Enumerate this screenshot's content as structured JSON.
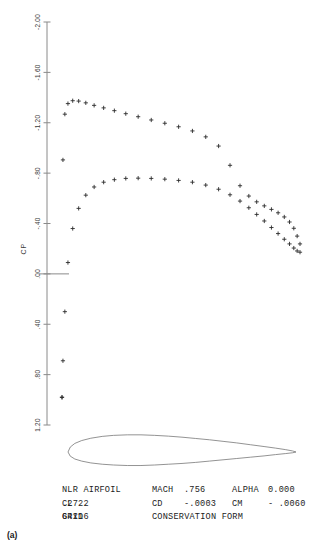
{
  "figure": {
    "panel_label": "(a)",
    "axis": {
      "ylabel": "CP",
      "yticks": [
        "-2.00",
        "-1.60",
        "-1.20",
        "-.80",
        "-.40",
        ".00",
        ".40",
        ".80",
        "1.20"
      ],
      "ytick_values": [
        -2.0,
        -1.6,
        -1.2,
        -0.8,
        -0.4,
        0.0,
        0.4,
        0.8,
        1.2
      ],
      "ylim": [
        -2.0,
        1.2
      ],
      "xlim": [
        0.0,
        1.0
      ],
      "grid": false,
      "zero_line": true
    },
    "annotation": {
      "rows": [
        [
          {
            "label": "NLR AIRFOIL",
            "value": ""
          },
          {
            "label": "MACH",
            "value": ".756"
          },
          {
            "label": "ALPHA",
            "value": "0.000"
          }
        ],
        [
          {
            "label": "CL",
            "value": ".2722"
          },
          {
            "label": "CD",
            "value": "-.0003"
          },
          {
            "label": "CM",
            "value": "- .0060"
          }
        ],
        [
          {
            "label": "GRID",
            "value": "64x16"
          },
          {
            "label": "CONSERVATION FORM",
            "value": ""
          },
          {
            "label": "",
            "value": ""
          }
        ]
      ]
    }
  },
  "chart_data": {
    "type": "scatter",
    "title": "",
    "xlabel": "",
    "ylabel": "CP",
    "ylim": [
      -2.0,
      1.2
    ],
    "xlim": [
      0.0,
      1.0
    ],
    "y_inverted": true,
    "grid": false,
    "legend_position": "none",
    "marker": "plus",
    "annotations": [
      "NLR AIRFOIL",
      "MACH .756",
      "ALPHA 0.000",
      "CL .2722",
      "CD -.0003",
      "CM - .0060",
      "GRID 64x16",
      "CONSERVATION FORM"
    ],
    "series": [
      {
        "name": "upper surface",
        "x": [
          0.0,
          0.004,
          0.012,
          0.025,
          0.045,
          0.07,
          0.1,
          0.135,
          0.175,
          0.22,
          0.268,
          0.32,
          0.375,
          0.432,
          0.49,
          0.548,
          0.604,
          0.658,
          0.706,
          0.748,
          0.785,
          0.818,
          0.85,
          0.88,
          0.908,
          0.934,
          0.956,
          0.974,
          0.988,
          1.0
        ],
        "y": [
          0.98,
          -0.905,
          -1.268,
          -1.352,
          -1.375,
          -1.372,
          -1.358,
          -1.338,
          -1.318,
          -1.296,
          -1.272,
          -1.248,
          -1.222,
          -1.196,
          -1.168,
          -1.135,
          -1.088,
          -1.015,
          -0.862,
          -0.7,
          -0.618,
          -0.572,
          -0.54,
          -0.512,
          -0.485,
          -0.452,
          -0.412,
          -0.362,
          -0.3,
          -0.238
        ]
      },
      {
        "name": "lower surface",
        "x": [
          0.0,
          0.004,
          0.012,
          0.025,
          0.045,
          0.07,
          0.1,
          0.135,
          0.175,
          0.22,
          0.268,
          0.32,
          0.375,
          0.432,
          0.49,
          0.548,
          0.604,
          0.658,
          0.706,
          0.748,
          0.785,
          0.818,
          0.85,
          0.88,
          0.908,
          0.934,
          0.956,
          0.974,
          0.988,
          1.0
        ],
        "y": [
          0.98,
          0.69,
          0.3,
          -0.09,
          -0.36,
          -0.52,
          -0.625,
          -0.69,
          -0.728,
          -0.748,
          -0.758,
          -0.76,
          -0.758,
          -0.752,
          -0.742,
          -0.728,
          -0.705,
          -0.672,
          -0.628,
          -0.578,
          -0.525,
          -0.472,
          -0.42,
          -0.368,
          -0.32,
          -0.275,
          -0.238,
          -0.205,
          -0.182,
          -0.172
        ]
      }
    ],
    "airfoil": {
      "name": "NLR airfoil section",
      "chord_x": [
        0.0,
        0.01,
        0.03,
        0.06,
        0.1,
        0.15,
        0.2,
        0.26,
        0.32,
        0.38,
        0.44,
        0.5,
        0.56,
        0.62,
        0.68,
        0.74,
        0.8,
        0.86,
        0.91,
        0.955,
        0.985,
        1.0
      ],
      "upper_t": [
        0.0,
        0.019,
        0.033,
        0.044,
        0.053,
        0.06,
        0.064,
        0.066,
        0.066,
        0.064,
        0.061,
        0.057,
        0.052,
        0.047,
        0.041,
        0.035,
        0.028,
        0.021,
        0.015,
        0.009,
        0.004,
        0.0
      ],
      "lower_t": [
        0.0,
        -0.016,
        -0.027,
        -0.035,
        -0.042,
        -0.047,
        -0.05,
        -0.052,
        -0.052,
        -0.05,
        -0.047,
        -0.044,
        -0.04,
        -0.035,
        -0.03,
        -0.025,
        -0.02,
        -0.015,
        -0.01,
        -0.006,
        -0.003,
        0.0
      ]
    }
  }
}
